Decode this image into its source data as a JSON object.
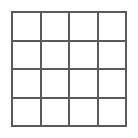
{
  "figure": {
    "kind": "grid-diagram",
    "title": "",
    "canvas": {
      "width": 138,
      "height": 138,
      "background_color": "#ffffff"
    },
    "grid": {
      "rows": 4,
      "columns": 4,
      "cell_count": 16,
      "line_color": "#5a5a5a",
      "line_width_px": 2,
      "cell_fill_color": "#ffffff",
      "outer_left_px": 11,
      "outer_top_px": 11,
      "outer_width_px": 116,
      "outer_height_px": 116,
      "cell_size_px": 27
    },
    "cells": [
      {
        "id": "r1c1",
        "row": 1,
        "column": 1,
        "label": ""
      },
      {
        "id": "r1c2",
        "row": 1,
        "column": 2,
        "label": ""
      },
      {
        "id": "r1c3",
        "row": 1,
        "column": 3,
        "label": ""
      },
      {
        "id": "r1c4",
        "row": 1,
        "column": 4,
        "label": ""
      },
      {
        "id": "r2c1",
        "row": 2,
        "column": 1,
        "label": ""
      },
      {
        "id": "r2c2",
        "row": 2,
        "column": 2,
        "label": ""
      },
      {
        "id": "r2c3",
        "row": 2,
        "column": 3,
        "label": ""
      },
      {
        "id": "r2c4",
        "row": 2,
        "column": 4,
        "label": ""
      },
      {
        "id": "r3c1",
        "row": 3,
        "column": 1,
        "label": ""
      },
      {
        "id": "r3c2",
        "row": 3,
        "column": 2,
        "label": ""
      },
      {
        "id": "r3c3",
        "row": 3,
        "column": 3,
        "label": ""
      },
      {
        "id": "r3c4",
        "row": 3,
        "column": 4,
        "label": ""
      },
      {
        "id": "r4c1",
        "row": 4,
        "column": 1,
        "label": ""
      },
      {
        "id": "r4c2",
        "row": 4,
        "column": 2,
        "label": ""
      },
      {
        "id": "r4c3",
        "row": 4,
        "column": 3,
        "label": ""
      },
      {
        "id": "r4c4",
        "row": 4,
        "column": 4,
        "label": ""
      }
    ]
  }
}
